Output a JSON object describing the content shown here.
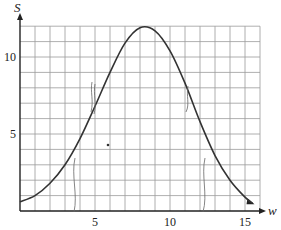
{
  "chart_data": {
    "type": "line",
    "title": "",
    "xlabel": "w",
    "ylabel": "S",
    "xlim": [
      0,
      16
    ],
    "ylim": [
      0,
      12
    ],
    "grid": true,
    "x_ticks": [
      5,
      10,
      15
    ],
    "y_ticks": [
      5,
      10
    ],
    "x_tick_labels": [
      "5",
      "10",
      "15"
    ],
    "y_tick_labels": [
      "5",
      "10"
    ],
    "series": [
      {
        "name": "S(w)",
        "x": [
          0,
          1,
          2,
          3,
          4,
          5,
          6,
          7,
          8,
          9,
          10,
          11,
          12,
          13,
          14,
          15,
          15.5
        ],
        "values": [
          0.6,
          1.0,
          1.8,
          3.0,
          4.7,
          6.8,
          9.0,
          10.9,
          11.9,
          11.7,
          10.4,
          8.3,
          5.8,
          3.6,
          2.0,
          0.9,
          0.5
        ]
      }
    ],
    "annotations": [
      "hand-drawn tick marks near w≈5 and w≈11 at S≈7",
      "hand-drawn vertical lines near w≈3.5 and w≈12.5",
      "small dot near w≈6, S≈4"
    ],
    "legend": null
  }
}
